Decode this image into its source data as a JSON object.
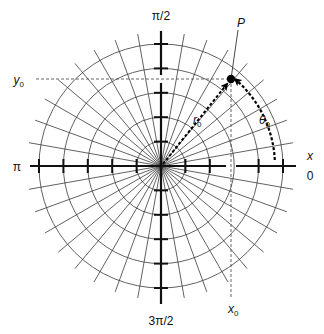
{
  "diagram": {
    "type": "polar-coordinate-grid",
    "center": {
      "x": 161,
      "y": 166
    },
    "circle_count": 5,
    "circle_step": 24.4,
    "radial_spacing_deg": 10,
    "radial_extent": 134,
    "colors": {
      "grid": "#3a3a3a",
      "axis": "#111111",
      "dashed": "#555555",
      "point": "#000000"
    }
  },
  "axis_labels": {
    "top": "π/2",
    "bottom": "3π/2",
    "left": "π",
    "right_axis": "x",
    "right_zero": "0"
  },
  "point": {
    "label": "P",
    "coord_x_label": "x",
    "coord_x_sub": "0",
    "coord_y_label": "y",
    "coord_y_sub": "0",
    "radius_label": "r",
    "radius_sub": "0",
    "angle_label": "θ",
    "angle_sub": "0"
  }
}
